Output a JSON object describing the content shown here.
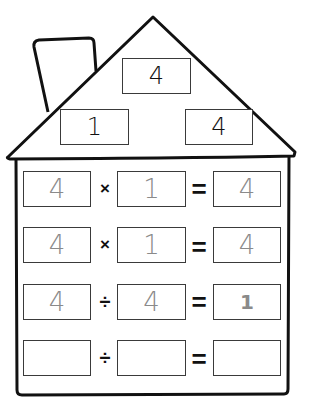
{
  "worksheet": {
    "title": "Fact Family House",
    "roof": {
      "top_number": "4",
      "left_number": "1",
      "right_number": "4"
    },
    "rows": [
      {
        "a": "4",
        "op": "×",
        "b": "1",
        "eq": "=",
        "result": "4"
      },
      {
        "a": "4",
        "op": "×",
        "b": "1",
        "eq": "=",
        "result": "4"
      },
      {
        "a": "4",
        "op": "÷",
        "b": "4",
        "eq": "=",
        "result": "1"
      },
      {
        "a": "",
        "op": "÷",
        "b": "",
        "eq": "=",
        "result": ""
      }
    ],
    "colors": {
      "outline": "#111111",
      "box_border": "#3a3a3a",
      "handwriting": "#8a8a8a",
      "background": "#ffffff"
    }
  }
}
